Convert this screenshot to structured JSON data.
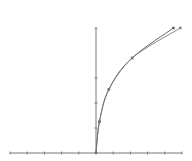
{
  "chart_data": {
    "type": "line",
    "title": "",
    "xlabel": "",
    "ylabel": "",
    "grid": false,
    "legend": null,
    "xlim": [
      -5,
      5
    ],
    "ylim": [
      0,
      5
    ],
    "x_ticks": [
      -5,
      -4,
      -3,
      -2,
      -1,
      0,
      1,
      2,
      3,
      4,
      5
    ],
    "y_ticks": [
      0,
      1,
      2,
      3,
      5
    ],
    "tick_labels_visible": false,
    "series": [
      {
        "name": "curve-1",
        "color": "#555555",
        "x": [
          0,
          0.2,
          0.75,
          2.1,
          4.5
        ],
        "y": [
          0,
          1.25,
          2.55,
          3.8,
          5.0
        ],
        "markers": true
      },
      {
        "name": "curve-2",
        "color": "#777777",
        "x": [
          0,
          0.2,
          0.75,
          2.1,
          4.9
        ],
        "y": [
          0,
          1.25,
          2.55,
          3.8,
          5.0
        ],
        "markers": true
      }
    ],
    "colors": {
      "axis": "#555555",
      "line": "#555555",
      "background": "#ffffff"
    }
  },
  "plot_area": {
    "left": 10,
    "right": 182,
    "top": 28,
    "bottom": 153,
    "origin_x": 96
  }
}
